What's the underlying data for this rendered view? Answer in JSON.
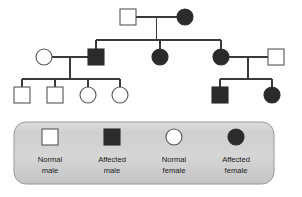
{
  "figure": {
    "kind": "pedigree-chart",
    "background_color": "#ffffff",
    "line_color": "#3a3a3a",
    "shape_stroke_color": "#555555",
    "affected_fill": "#2b2b2b",
    "normal_fill": "#ffffff"
  },
  "generations": [
    {
      "id": "generation-1",
      "individuals": [
        {
          "id": "I-1",
          "sex": "male",
          "shape": "square",
          "status": "normal",
          "x": 128,
          "y": 17
        },
        {
          "id": "I-2",
          "sex": "female",
          "shape": "circle",
          "status": "affected",
          "x": 185,
          "y": 17
        }
      ]
    },
    {
      "id": "generation-2",
      "individuals": [
        {
          "id": "II-1",
          "sex": "female",
          "shape": "circle",
          "status": "normal",
          "x": 44,
          "y": 57
        },
        {
          "id": "II-2",
          "sex": "male",
          "shape": "square",
          "status": "affected",
          "x": 96,
          "y": 57
        },
        {
          "id": "II-3",
          "sex": "female",
          "shape": "circle",
          "status": "affected",
          "x": 160,
          "y": 57
        },
        {
          "id": "II-4",
          "sex": "female",
          "shape": "circle",
          "status": "affected",
          "x": 221,
          "y": 57
        },
        {
          "id": "II-5",
          "sex": "male",
          "shape": "square",
          "status": "normal",
          "x": 276,
          "y": 57
        }
      ]
    },
    {
      "id": "generation-3",
      "individuals": [
        {
          "id": "III-1",
          "sex": "male",
          "shape": "square",
          "status": "normal",
          "x": 22,
          "y": 95
        },
        {
          "id": "III-2",
          "sex": "male",
          "shape": "square",
          "status": "normal",
          "x": 55,
          "y": 95
        },
        {
          "id": "III-3",
          "sex": "female",
          "shape": "circle",
          "status": "normal",
          "x": 88,
          "y": 95
        },
        {
          "id": "III-4",
          "sex": "female",
          "shape": "circle",
          "status": "normal",
          "x": 120,
          "y": 95
        },
        {
          "id": "III-5",
          "sex": "male",
          "shape": "square",
          "status": "affected",
          "x": 220,
          "y": 95
        },
        {
          "id": "III-6",
          "sex": "female",
          "shape": "circle",
          "status": "affected",
          "x": 272,
          "y": 95
        }
      ]
    }
  ],
  "legend": {
    "box": {
      "x": 14,
      "y": 122,
      "width": 260,
      "height": 62,
      "radius": 12
    },
    "entries": [
      {
        "id": "legend-normal-male",
        "shape": "square",
        "status": "normal",
        "line1": "Normal",
        "line2": "male",
        "x": 50
      },
      {
        "id": "legend-affected-male",
        "shape": "square",
        "status": "affected",
        "line1": "Affected",
        "line2": "male",
        "x": 112
      },
      {
        "id": "legend-normal-female",
        "shape": "circle",
        "status": "normal",
        "line1": "Normal",
        "line2": "female",
        "x": 174
      },
      {
        "id": "legend-affected-female",
        "shape": "circle",
        "status": "affected",
        "line1": "Affected",
        "line2": "female",
        "x": 236
      }
    ]
  }
}
